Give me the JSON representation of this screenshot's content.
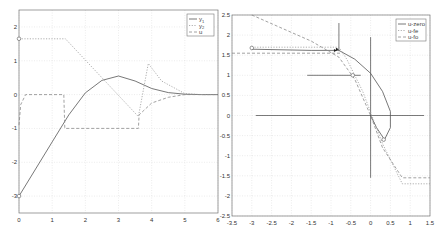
{
  "chart_data": [
    {
      "type": "line",
      "title": "",
      "xlabel": "",
      "ylabel": "",
      "xlim": [
        0,
        6
      ],
      "ylim": [
        -3.5,
        2.5
      ],
      "xticks": [
        "0",
        "1",
        "2",
        "3",
        "4",
        "5",
        "6"
      ],
      "yticks": [
        "-3",
        "-2",
        "-1",
        "0",
        "1",
        "2"
      ],
      "grid": true,
      "legend_position": "upper right",
      "legend": [
        "y1",
        "y2",
        "u"
      ],
      "series": [
        {
          "name": "y1",
          "style": "solid",
          "x": [
            0,
            0.5,
            1.0,
            1.5,
            2.0,
            2.5,
            3.0,
            3.5,
            4.0,
            4.5,
            5.0,
            5.5,
            6.0
          ],
          "y": [
            -3.0,
            -2.2,
            -1.4,
            -0.6,
            0.05,
            0.42,
            0.55,
            0.4,
            0.18,
            0.06,
            0.01,
            0.0,
            0.0
          ]
        },
        {
          "name": "y2",
          "style": "dotted",
          "x": [
            0,
            1.4,
            3.6,
            3.9,
            4.3,
            5.0,
            5.5,
            6.0
          ],
          "y": [
            1.65,
            1.65,
            -0.65,
            0.92,
            0.4,
            0.03,
            0.0,
            0.0
          ]
        },
        {
          "name": "u",
          "style": "dashed",
          "x": [
            0,
            0.05,
            0.2,
            1.35,
            1.38,
            3.6,
            3.62,
            4.0,
            4.5,
            5.0,
            6.0
          ],
          "y": [
            -0.9,
            -0.3,
            0.0,
            0.0,
            -1.0,
            -1.0,
            -0.6,
            -0.25,
            -0.08,
            0.0,
            0.0
          ]
        }
      ],
      "annotations": [
        {
          "type": "circle-marker",
          "x": 0,
          "y": 1.65
        },
        {
          "type": "circle-marker",
          "x": 0,
          "y": -3.0
        }
      ]
    },
    {
      "type": "line",
      "title": "",
      "xlabel": "",
      "ylabel": "",
      "xlim": [
        -3.5,
        1.5
      ],
      "ylim": [
        -2.5,
        2.5
      ],
      "xticks": [
        "-3.5",
        "-3",
        "-2.5",
        "-2",
        "-1.5",
        "-1",
        "-0.5",
        "0",
        "0.5",
        "1",
        "1.5"
      ],
      "yticks": [
        "-2.5",
        "-2",
        "-1.5",
        "-1",
        "-0.5",
        "0",
        "0.5",
        "1",
        "1.5",
        "2",
        "2.5"
      ],
      "grid": true,
      "legend_position": "upper right",
      "legend": [
        "u-zero",
        "u-fe",
        "u-fo"
      ],
      "series": [
        {
          "name": "u-zero",
          "style": "solid",
          "x": [
            -3.0,
            -1.5,
            -0.8,
            -0.4,
            0.0,
            0.3,
            0.5,
            0.5,
            0.35,
            0.15,
            0.0
          ],
          "y": [
            1.65,
            1.62,
            1.62,
            1.4,
            1.05,
            0.6,
            0.1,
            -0.3,
            -0.6,
            -0.3,
            0.0
          ]
        },
        {
          "name": "u-fe",
          "style": "dotted",
          "x": [
            -3.0,
            -0.8,
            -0.6,
            -0.2,
            0.3,
            0.8,
            1.5
          ],
          "y": [
            1.7,
            1.7,
            1.4,
            0.6,
            -0.7,
            -1.7,
            -1.7
          ]
        },
        {
          "name": "u-fo",
          "style": "dashed",
          "x": [
            -3.0,
            -1.5,
            -0.8,
            -0.4,
            0.0,
            0.3,
            0.8,
            1.5
          ],
          "y": [
            2.5,
            1.85,
            1.45,
            0.9,
            0.0,
            -0.8,
            -1.55,
            -1.55
          ]
        },
        {
          "name": "horizontal-1.55",
          "style": "dashed",
          "x": [
            -3.5,
            -0.75
          ],
          "y": [
            1.55,
            1.55
          ]
        }
      ],
      "reference_lines": [
        {
          "orientation": "horizontal",
          "y": 0,
          "x_from": -2.9,
          "x_to": 1.35
        },
        {
          "orientation": "vertical",
          "x": 0,
          "y_from": -1.55,
          "y_to": 1.95
        },
        {
          "orientation": "horizontal",
          "y": 1.0,
          "x_from": -1.6,
          "x_to": -0.25
        },
        {
          "orientation": "vertical",
          "x": -0.8,
          "y_from": 1.6,
          "y_to": 2.3
        }
      ],
      "annotations": [
        {
          "type": "circle-marker",
          "x": -3.0,
          "y": 1.68
        },
        {
          "type": "circle-marker",
          "x": -0.45,
          "y": 1.0
        },
        {
          "type": "circle-marker",
          "x": 0.33,
          "y": -0.6
        },
        {
          "type": "arrow-marker",
          "x": -0.8,
          "y": 1.65
        },
        {
          "type": "arrow-marker",
          "x": -0.85,
          "y": 1.62
        }
      ]
    }
  ]
}
